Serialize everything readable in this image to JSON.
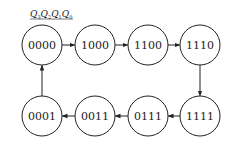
{
  "header": {
    "variables": [
      {
        "name": "Q",
        "sub": "3"
      },
      {
        "name": "Q",
        "sub": "2"
      },
      {
        "name": "Q",
        "sub": "1"
      },
      {
        "name": "Q",
        "sub": "0"
      }
    ]
  },
  "states": [
    {
      "label": "0000",
      "cx": 42,
      "cy": 45
    },
    {
      "label": "1000",
      "cx": 95,
      "cy": 45
    },
    {
      "label": "1100",
      "cx": 148,
      "cy": 45
    },
    {
      "label": "1110",
      "cx": 200,
      "cy": 45
    },
    {
      "label": "1111",
      "cx": 200,
      "cy": 116
    },
    {
      "label": "0111",
      "cx": 148,
      "cy": 116
    },
    {
      "label": "0011",
      "cx": 95,
      "cy": 116
    },
    {
      "label": "0001",
      "cx": 42,
      "cy": 116
    }
  ],
  "transitions": [
    [
      "0000",
      "1000"
    ],
    [
      "1000",
      "1100"
    ],
    [
      "1100",
      "1110"
    ],
    [
      "1110",
      "1111"
    ],
    [
      "1111",
      "0111"
    ],
    [
      "0111",
      "0011"
    ],
    [
      "0011",
      "0001"
    ],
    [
      "0001",
      "0000"
    ]
  ],
  "style": {
    "stroke": "#222222",
    "radius": 20
  }
}
